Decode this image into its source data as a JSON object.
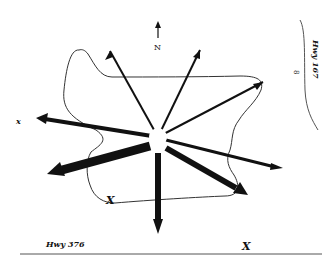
{
  "diagram": {
    "type": "wind-rose / directional flow map",
    "north_label": "N",
    "highway_right_label": "Hwy 167",
    "highway_right_marker": "8",
    "highway_bottom_label": "Hwy 376",
    "left_marker": "x",
    "marker_inside": "X",
    "marker_bottom_right": "X",
    "colors": {
      "ink": "#111111",
      "background": "#ffffff",
      "boundary": "#333333",
      "road": "#555555"
    },
    "hub": {
      "x": 158,
      "y": 137,
      "r": 9
    },
    "arrows": [
      {
        "dir": "NNW",
        "x2": 110,
        "y2": 51,
        "w": 2
      },
      {
        "dir": "NNE",
        "x2": 200,
        "y2": 50,
        "w": 2
      },
      {
        "dir": "NE",
        "x2": 263,
        "y2": 82,
        "w": 2
      },
      {
        "dir": "W",
        "x2": 37,
        "y2": 118,
        "w": 4
      },
      {
        "dir": "WSW",
        "x2": 48,
        "y2": 174,
        "w": 9
      },
      {
        "dir": "S",
        "x2": 158,
        "y2": 233,
        "w": 7
      },
      {
        "dir": "ESE",
        "x2": 282,
        "y2": 168,
        "w": 3
      },
      {
        "dir": "SE",
        "x2": 246,
        "y2": 194,
        "w": 6
      }
    ]
  }
}
